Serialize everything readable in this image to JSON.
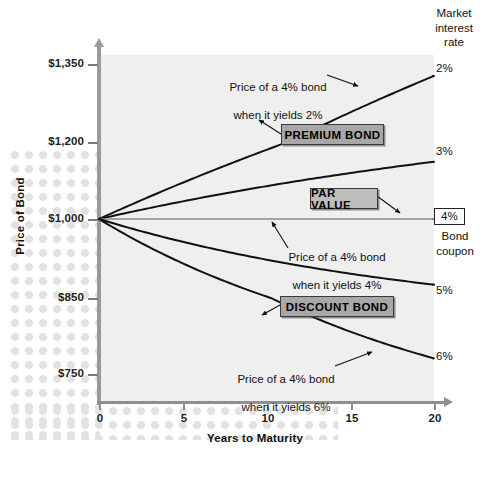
{
  "chart_data": {
    "type": "line",
    "title": "",
    "xlabel": "Years to Maturity",
    "ylabel": "Price of Bond",
    "x": [
      0,
      5,
      10,
      15,
      20
    ],
    "xlim": [
      0,
      20
    ],
    "ylim": [
      700,
      1380
    ],
    "xticks": [
      "0",
      "5",
      "10",
      "15",
      "20"
    ],
    "yticks": [
      "$1,350",
      "$1,200",
      "$1,000",
      "$850",
      "$750"
    ],
    "ytick_values": [
      1350,
      1200,
      1000,
      850,
      750
    ],
    "grid": false,
    "legend_position": "right",
    "legend_title": "Market\ninterest\nrate",
    "series": [
      {
        "name": "2%",
        "yield_pct": 2,
        "label": "2%",
        "values": [
          1000,
          1094,
          1179,
          1257,
          1327
        ],
        "note": "Price of a 4% bond\nwhen it yields 2%"
      },
      {
        "name": "3%",
        "yield_pct": 3,
        "label": "3%",
        "values": [
          1000,
          1046,
          1085,
          1119,
          1149
        ],
        "note": ""
      },
      {
        "name": "4%",
        "yield_pct": 4,
        "label": "4%",
        "values": [
          1000,
          1000,
          1000,
          1000,
          1000
        ],
        "note": "Price of a 4% bond\nwhen it yields 4%"
      },
      {
        "name": "5%",
        "yield_pct": 5,
        "label": "5%",
        "values": [
          1000,
          957,
          923,
          896,
          875
        ],
        "note": ""
      },
      {
        "name": "6%",
        "yield_pct": 6,
        "label": "6%",
        "values": [
          1000,
          916,
          853,
          806,
          771
        ],
        "note": "Price of a 4% bond\nwhen it yields 6%"
      }
    ],
    "annotations": [
      {
        "text": "PREMIUM BOND",
        "kind": "callout"
      },
      {
        "text": "PAR VALUE",
        "kind": "callout"
      },
      {
        "text": "DISCOUNT BOND",
        "kind": "callout"
      }
    ]
  },
  "axis": {
    "y_title": "Price of Bond",
    "x_title": "Years to Maturity",
    "y_labels": [
      "$1,350",
      "$1,200",
      "$1,000",
      "$850",
      "$750"
    ],
    "x_labels": [
      "0",
      "5",
      "10",
      "15",
      "20"
    ]
  },
  "legend": {
    "header_line1": "Market",
    "header_line2": "interest",
    "header_line3": "rate",
    "rate_2": "2%",
    "rate_3": "3%",
    "rate_5": "5%",
    "rate_6": "6%",
    "coupon_value": "4%",
    "coupon_caption_line1": "Bond",
    "coupon_caption_line2": "coupon"
  },
  "callouts": {
    "premium": "PREMIUM BOND",
    "par": "PAR VALUE",
    "discount": "DISCOUNT BOND"
  },
  "notes": {
    "yield2_line1": "Price of a 4% bond",
    "yield2_line2": "when it yields 2%",
    "yield4_line1": "Price of a 4% bond",
    "yield4_line2": "when it yields 4%",
    "yield6_line1": "Price of a 4% bond",
    "yield6_line2": "when it yields 6%"
  },
  "colors": {
    "plot_background": "#efefef",
    "page_background": "#ffffff",
    "curve": "#111111",
    "axis": "#8f8f8f",
    "callout_fill": "#a8a8a8",
    "callout_border": "#3a3a3a",
    "dots": "#e2e2e2"
  }
}
